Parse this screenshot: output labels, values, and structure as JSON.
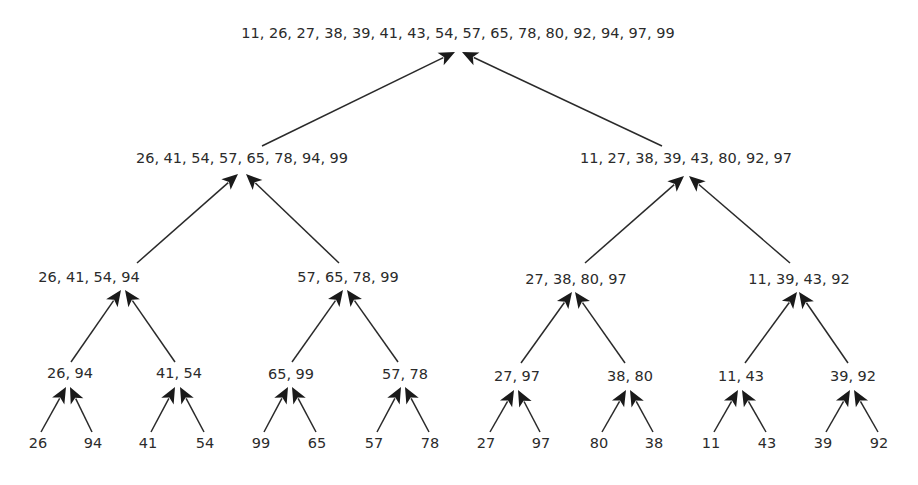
{
  "diagram": {
    "type": "merge-sort-tree",
    "colors": {
      "line": "#2a2a2a",
      "arrow": "#1a1a1a",
      "text": "#2b2b2b",
      "background": "#ffffff"
    },
    "nodes": [
      {
        "id": "root",
        "label": "11, 26, 27, 38, 39, 41, 43, 54, 57, 65, 78, 80, 92, 94, 97, 99",
        "x": 458,
        "y": 33
      },
      {
        "id": "L",
        "label": "26, 41, 54, 57, 65, 78, 94, 99",
        "x": 242,
        "y": 158
      },
      {
        "id": "R",
        "label": "11, 27, 38, 39, 43, 80, 92, 97",
        "x": 686,
        "y": 158
      },
      {
        "id": "LL",
        "label": "26, 41, 54, 94",
        "x": 89,
        "y": 277
      },
      {
        "id": "LR",
        "label": "57, 65, 78, 99",
        "x": 348,
        "y": 277
      },
      {
        "id": "RL",
        "label": "27, 38, 80, 97",
        "x": 576,
        "y": 279
      },
      {
        "id": "RR",
        "label": "11, 39, 43, 92",
        "x": 799,
        "y": 279
      },
      {
        "id": "LLL",
        "label": "26, 94",
        "x": 70,
        "y": 373
      },
      {
        "id": "LLR",
        "label": "41, 54",
        "x": 179,
        "y": 373
      },
      {
        "id": "LRL",
        "label": "65, 99",
        "x": 291,
        "y": 374
      },
      {
        "id": "LRR",
        "label": "57, 78",
        "x": 405,
        "y": 374
      },
      {
        "id": "RLL",
        "label": "27, 97",
        "x": 517,
        "y": 376
      },
      {
        "id": "RLR",
        "label": "38, 80",
        "x": 630,
        "y": 376
      },
      {
        "id": "RRL",
        "label": "11, 43",
        "x": 741,
        "y": 376
      },
      {
        "id": "RRR",
        "label": "39, 92",
        "x": 853,
        "y": 376
      },
      {
        "id": "l1",
        "label": "26",
        "x": 38,
        "y": 443
      },
      {
        "id": "l2",
        "label": "94",
        "x": 93,
        "y": 443
      },
      {
        "id": "l3",
        "label": "41",
        "x": 148,
        "y": 443
      },
      {
        "id": "l4",
        "label": "54",
        "x": 205,
        "y": 443
      },
      {
        "id": "l5",
        "label": "99",
        "x": 261,
        "y": 443
      },
      {
        "id": "l6",
        "label": "65",
        "x": 317,
        "y": 443
      },
      {
        "id": "l7",
        "label": "57",
        "x": 374,
        "y": 443
      },
      {
        "id": "l8",
        "label": "78",
        "x": 430,
        "y": 443
      },
      {
        "id": "l9",
        "label": "27",
        "x": 486,
        "y": 443
      },
      {
        "id": "l10",
        "label": "97",
        "x": 541,
        "y": 443
      },
      {
        "id": "l11",
        "label": "80",
        "x": 599,
        "y": 443
      },
      {
        "id": "l12",
        "label": "38",
        "x": 654,
        "y": 443
      },
      {
        "id": "l13",
        "label": "11",
        "x": 711,
        "y": 443
      },
      {
        "id": "l14",
        "label": "43",
        "x": 767,
        "y": 443
      },
      {
        "id": "l15",
        "label": "39",
        "x": 823,
        "y": 443
      },
      {
        "id": "l16",
        "label": "92",
        "x": 879,
        "y": 443
      }
    ],
    "edges": [
      {
        "from": [
          262,
          146
        ],
        "to": [
          455,
          52
        ]
      },
      {
        "from": [
          662,
          146
        ],
        "to": [
          462,
          52
        ]
      },
      {
        "from": [
          137,
          263
        ],
        "to": [
          238,
          174
        ]
      },
      {
        "from": [
          339,
          263
        ],
        "to": [
          246,
          174
        ]
      },
      {
        "from": [
          585,
          263
        ],
        "to": [
          684,
          176
        ]
      },
      {
        "from": [
          790,
          263
        ],
        "to": [
          689,
          176
        ]
      },
      {
        "from": [
          71,
          362
        ],
        "to": [
          121,
          290
        ]
      },
      {
        "from": [
          175,
          362
        ],
        "to": [
          125,
          290
        ]
      },
      {
        "from": [
          292,
          362
        ],
        "to": [
          343,
          290
        ]
      },
      {
        "from": [
          398,
          362
        ],
        "to": [
          347,
          290
        ]
      },
      {
        "from": [
          521,
          363
        ],
        "to": [
          572,
          292
        ]
      },
      {
        "from": [
          625,
          363
        ],
        "to": [
          575,
          292
        ]
      },
      {
        "from": [
          745,
          363
        ],
        "to": [
          797,
          292
        ]
      },
      {
        "from": [
          848,
          363
        ],
        "to": [
          799,
          292
        ]
      },
      {
        "from": [
          41,
          432
        ],
        "to": [
          66,
          387
        ]
      },
      {
        "from": [
          92,
          432
        ],
        "to": [
          70,
          387
        ]
      },
      {
        "from": [
          151,
          432
        ],
        "to": [
          175,
          387
        ]
      },
      {
        "from": [
          204,
          432
        ],
        "to": [
          180,
          387
        ]
      },
      {
        "from": [
          264,
          432
        ],
        "to": [
          288,
          387
        ]
      },
      {
        "from": [
          316,
          432
        ],
        "to": [
          292,
          387
        ]
      },
      {
        "from": [
          377,
          432
        ],
        "to": [
          401,
          387
        ]
      },
      {
        "from": [
          429,
          432
        ],
        "to": [
          405,
          387
        ]
      },
      {
        "from": [
          490,
          432
        ],
        "to": [
          514,
          390
        ]
      },
      {
        "from": [
          540,
          432
        ],
        "to": [
          518,
          390
        ]
      },
      {
        "from": [
          602,
          432
        ],
        "to": [
          626,
          390
        ]
      },
      {
        "from": [
          653,
          432
        ],
        "to": [
          630,
          390
        ]
      },
      {
        "from": [
          714,
          432
        ],
        "to": [
          738,
          390
        ]
      },
      {
        "from": [
          766,
          432
        ],
        "to": [
          742,
          390
        ]
      },
      {
        "from": [
          826,
          432
        ],
        "to": [
          850,
          390
        ]
      },
      {
        "from": [
          878,
          432
        ],
        "to": [
          854,
          390
        ]
      }
    ]
  }
}
